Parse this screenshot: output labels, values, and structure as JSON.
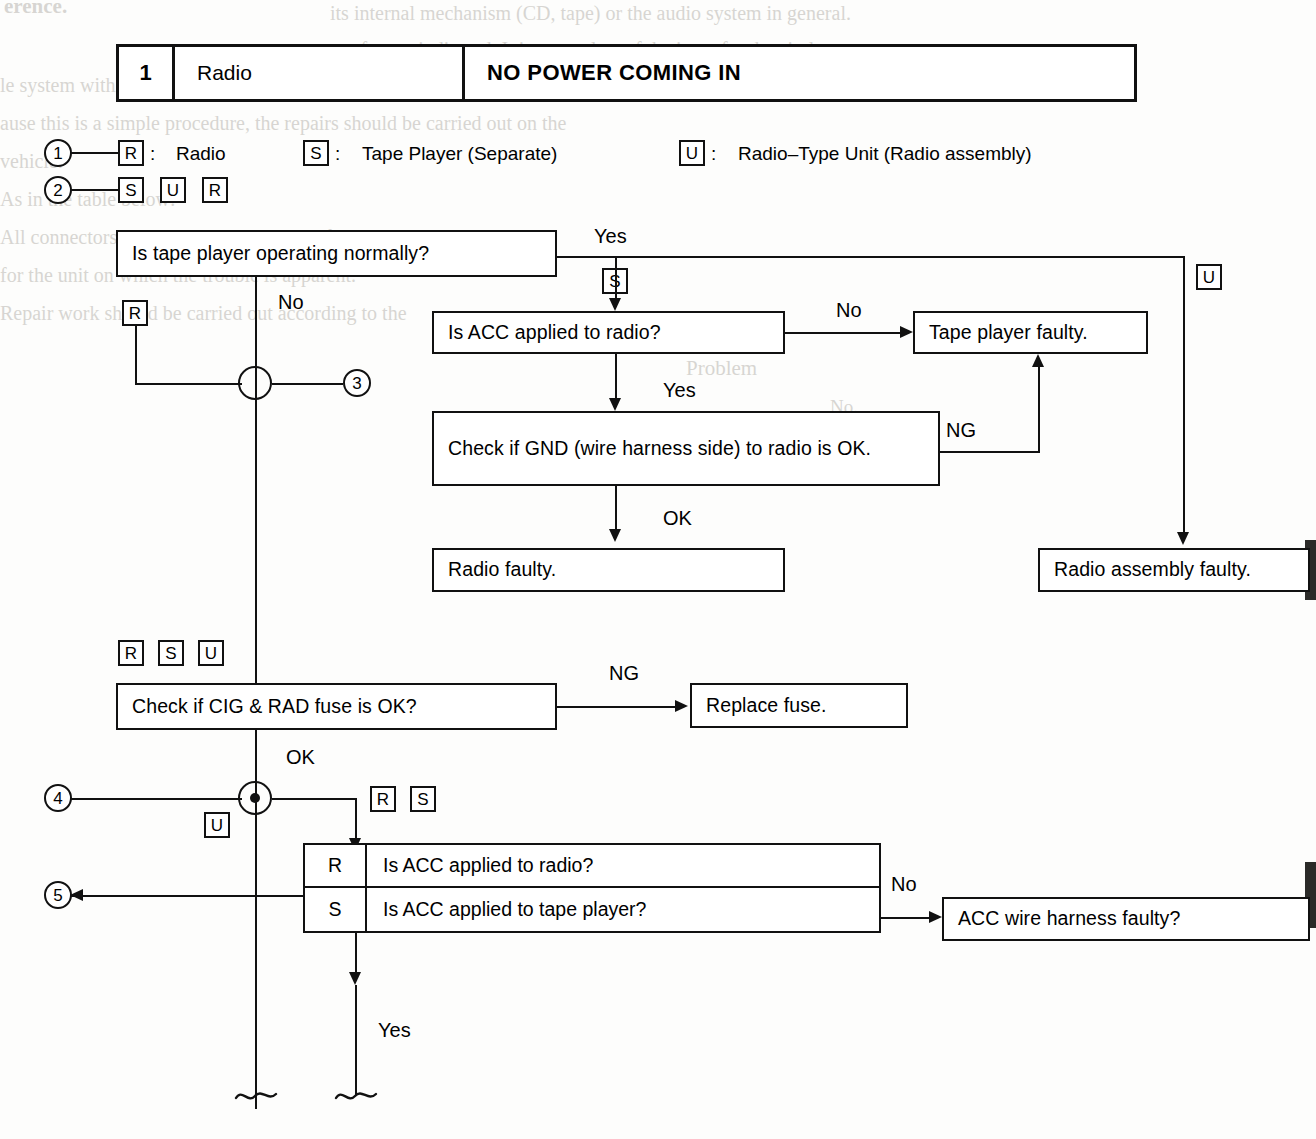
{
  "header": {
    "number": "1",
    "system": "Radio",
    "symptom": "NO POWER COMING IN"
  },
  "legend": {
    "row1_ref": "1",
    "row1": [
      {
        "chip": "R",
        "sep": ":",
        "text": "Radio"
      },
      {
        "chip": "S",
        "sep": ":",
        "text": "Tape Player (Separate)"
      },
      {
        "chip": "U",
        "sep": ":",
        "text": "Radio–Type Unit (Radio assembly)"
      }
    ],
    "row2_ref": "2",
    "row2_chips": [
      "S",
      "U",
      "R"
    ]
  },
  "flow": {
    "q_tape_player": "Is tape player operating normally?",
    "q_acc_radio": "Is ACC applied to radio?",
    "q_gnd": "Check if GND (wire harness side) to radio is OK.",
    "r_radio_faulty": "Radio faulty.",
    "r_tape_faulty": "Tape player faulty.",
    "r_radio_assy_faulty": "Radio assembly faulty.",
    "q_fuse": "Check if CIG & RAD fuse is OK?",
    "r_replace_fuse": "Replace fuse.",
    "r_acc_harness": "ACC wire harness faulty?"
  },
  "decision_table": {
    "rows": [
      {
        "key": "R",
        "question": "Is ACC applied to radio?"
      },
      {
        "key": "S",
        "question": "Is ACC applied to tape player?"
      }
    ]
  },
  "labels": {
    "yes": "Yes",
    "no": "No",
    "ok": "OK",
    "ng": "NG",
    "yes2": "Yes",
    "yes3": "Yes",
    "no2": "No",
    "no3": "No",
    "ng2": "NG",
    "ok2": "OK"
  },
  "chips": {
    "s_branch": "S",
    "u_right": "U",
    "r_left": "R",
    "rsu": [
      "R",
      "S",
      "U"
    ],
    "u_lower": "U",
    "rs": [
      "R",
      "S"
    ]
  },
  "refs": {
    "three": "3",
    "four": "4",
    "five": "5"
  },
  "ghost_text": {
    "g1": "erence.",
    "g2": "its internal mechanism (CD, tape) or the audio system in general.",
    "g3": "re often as indicated. It is a template of the issue for the circle to",
    "g4": "le system within.",
    "g5": "ause this is a simple procedure, the repairs should be carried out on the",
    "g6": "vehicle.",
    "g7": "As in the table below:",
    "g8": "All connectors should be checked in the following manner.",
    "g9": "for the unit on which the trouble is apparent.",
    "g10": "Repair work should be carried out according to the",
    "g11": "Problem",
    "g12": "No."
  },
  "colors": {
    "ink": "#111111",
    "paper": "#fdfdfc",
    "ghost": "#b9b6b0"
  }
}
